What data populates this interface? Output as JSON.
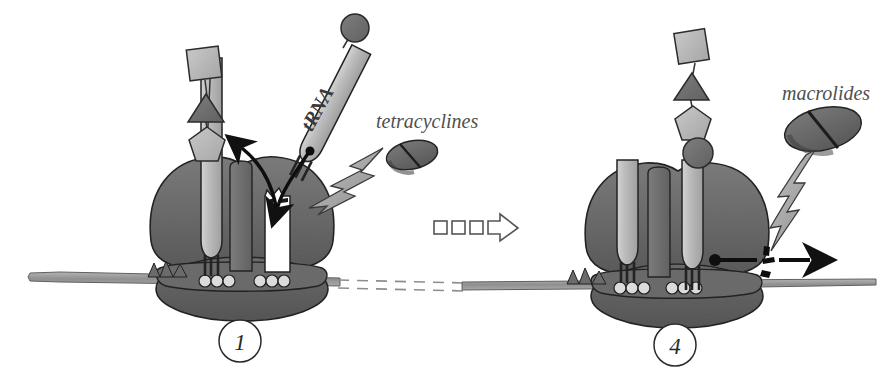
{
  "figure": {
    "background_color": "#ffffff"
  },
  "palette": {
    "ribosome_large_subunit": "#6e6e6e",
    "ribosome_small_subunit": "#5e5e5e",
    "ribosome_channel": "#707070",
    "trna_body": "#b9b9b9",
    "peptide_shape_light": "#b5b5b5",
    "peptide_shape_dark": "#707070",
    "drug_tablet": "#6b6b6b",
    "lightning": "#9d9d9d",
    "mrna_strand": "#9a9a9a",
    "outline": "#2b2b2b",
    "label_text": "#4f4f4f"
  },
  "panels": [
    {
      "id": "panel-1",
      "step_number": "1",
      "drug": {
        "name": "tetracyclines",
        "target_site": "A-site of the 30S small subunit",
        "tablet_count": 2,
        "effect": "blocks aminoacyl-tRNA binding to the A site"
      },
      "trna": {
        "label": "tRNA",
        "state": "incoming aminoacyl-tRNA, blocked"
      },
      "peptide_chain": {
        "shapes": [
          "square",
          "triangle",
          "pentagon"
        ],
        "tones": [
          "light",
          "dark",
          "light"
        ],
        "length": 3
      },
      "arrows": [
        {
          "name": "trna-entry-arc",
          "style": "curved-black",
          "direction": "toward A site"
        },
        {
          "name": "peptide-release-arc",
          "style": "curved-black",
          "direction": "up-left"
        }
      ],
      "ribosome_sites": {
        "P_site": "occupied by peptidyl-tRNA",
        "A_site": "empty / blocked"
      },
      "mrna": {
        "visible": true,
        "codon_markers": 3,
        "end_style": "rounded-left-tip"
      }
    },
    {
      "id": "panel-4",
      "step_number": "4",
      "drug": {
        "name": "macrolides",
        "target_site": "exit tunnel of the 50S large subunit",
        "tablet_count": 1,
        "effect": "blocks translocation / peptide exit"
      },
      "peptide_chain": {
        "shapes": [
          "square",
          "triangle",
          "pentagon",
          "circle"
        ],
        "tones": [
          "light",
          "dark",
          "light",
          "dark"
        ],
        "length": 4
      },
      "arrows": [
        {
          "name": "translocation-block-arrow",
          "style": "straight-black-with-dot",
          "direction": "right"
        }
      ],
      "ribosome_sites": {
        "P_site": "occupied",
        "A_site": "occupied by peptidyl-tRNA"
      },
      "mrna": {
        "visible": true,
        "codon_markers": 3,
        "end_style": "tapered-right-tip"
      }
    }
  ],
  "transition": {
    "name": "progression arrow",
    "style": "dashed-segments-with-open-arrowhead",
    "segment_count": 3,
    "direction": "left-to-right",
    "from_step": "1",
    "to_step": "4"
  },
  "labels": {
    "tetracyclines": "tetracyclines",
    "macrolides": "macrolides",
    "trna": "tRNA",
    "step_one": "1",
    "step_four": "4"
  }
}
